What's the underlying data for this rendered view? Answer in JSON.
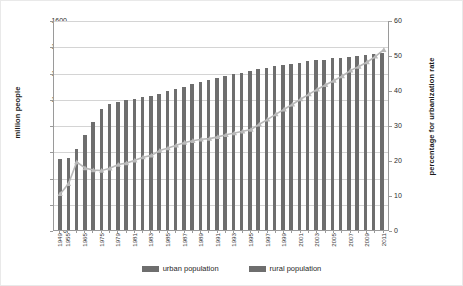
{
  "chart_data": {
    "type": "bar",
    "title": "",
    "xlabel": "",
    "ylabel": "million people",
    "y2label": "percentage for urbanization rate",
    "ylim": [
      0,
      1600
    ],
    "y2lim": [
      0,
      60
    ],
    "yticks": [
      0,
      200,
      400,
      600,
      800,
      1000,
      1200,
      1400,
      1600
    ],
    "y2ticks": [
      0,
      10,
      20,
      30,
      40,
      50,
      60
    ],
    "grid": true,
    "legend_position": "bottom",
    "legend": [
      "urban population",
      "rural population"
    ],
    "categories": [
      "1949",
      "1955",
      "1960",
      "1965",
      "1970",
      "1975",
      "1978",
      "1979",
      "1980",
      "1981",
      "1982",
      "1983",
      "1984",
      "1985",
      "1986",
      "1987",
      "1988",
      "1989",
      "1990",
      "1991",
      "1992",
      "1993",
      "1994",
      "1995",
      "1996",
      "1997",
      "1998",
      "1999",
      "2000",
      "2001",
      "2002",
      "2003",
      "2004",
      "2005",
      "2006",
      "2007",
      "2008",
      "2009",
      "2010",
      "2011"
    ],
    "axis_tick_labels": [
      "1949",
      "1955",
      "",
      "1965",
      "",
      "1975",
      "",
      "1979",
      "",
      "1981",
      "",
      "1983",
      "",
      "1985",
      "",
      "1987",
      "",
      "1989",
      "",
      "1991",
      "",
      "1993",
      "",
      "1995",
      "",
      "1997",
      "",
      "1999",
      "",
      "2001",
      "",
      "2003",
      "",
      "2005",
      "",
      "2007",
      "",
      "2009",
      "",
      "2011"
    ],
    "series": [
      {
        "name": "total population",
        "kind": "bar",
        "axis": "left",
        "color": "#6e6e6e",
        "values": [
          541,
          549,
          614,
          725,
          825,
          920,
          962,
          975,
          987,
          1000,
          1016,
          1024,
          1034,
          1058,
          1075,
          1093,
          1110,
          1127,
          1143,
          1158,
          1171,
          1185,
          1198,
          1211,
          1223,
          1236,
          1247,
          1257,
          1267,
          1276,
          1284,
          1292,
          1299,
          1307,
          1314,
          1321,
          1328,
          1334,
          1340,
          1347
        ]
      },
      {
        "name": "urbanization rate",
        "kind": "line",
        "axis": "right",
        "color": "#b9b9b9",
        "marker": "triangle",
        "values": [
          10.6,
          13.5,
          19.7,
          18.0,
          17.4,
          17.3,
          17.9,
          19.0,
          19.4,
          20.2,
          21.1,
          21.6,
          23.0,
          23.7,
          24.5,
          25.3,
          25.8,
          26.2,
          26.4,
          26.9,
          27.5,
          28.0,
          28.5,
          29.0,
          30.5,
          31.9,
          33.4,
          34.8,
          36.2,
          37.7,
          39.1,
          40.5,
          41.8,
          43.0,
          44.3,
          45.9,
          47.0,
          48.3,
          49.9,
          51.8
        ]
      }
    ]
  },
  "axes": {
    "left_title": "million people",
    "right_title": "percentage for urbanization rate"
  },
  "legend": {
    "items": [
      {
        "label": "urban population",
        "color": "#6e6e6e"
      },
      {
        "label": "rural population",
        "color": "#6e6e6e"
      }
    ]
  }
}
